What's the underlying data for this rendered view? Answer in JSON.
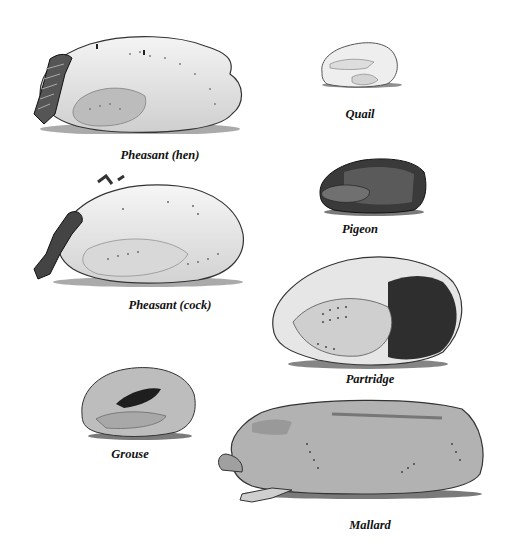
{
  "illustration": {
    "birds": [
      {
        "id": "pheasant-hen",
        "label": "Pheasant (hen)"
      },
      {
        "id": "pheasant-cock",
        "label": "Pheasant (cock)"
      },
      {
        "id": "quail",
        "label": "Quail"
      },
      {
        "id": "pigeon",
        "label": "Pigeon"
      },
      {
        "id": "partridge",
        "label": "Partridge"
      },
      {
        "id": "grouse",
        "label": "Grouse"
      },
      {
        "id": "mallard",
        "label": "Mallard"
      }
    ]
  }
}
